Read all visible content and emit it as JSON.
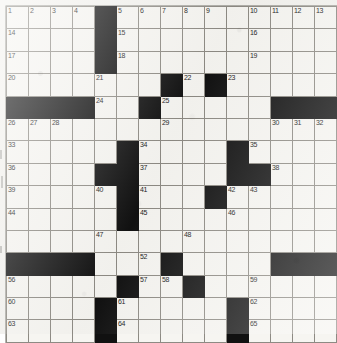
{
  "puzzle": {
    "type": "crossword-grid",
    "rows": 15,
    "columns": 15,
    "colors": {
      "paper": "#f3f2ee",
      "cell_fill": "#f6f5f1",
      "block_fill": "#111111",
      "grid_line": "#8d8a83",
      "number_text": "#1a1a1a"
    },
    "blocks": [
      [
        0,
        4
      ],
      [
        1,
        4
      ],
      [
        2,
        4
      ],
      [
        3,
        7
      ],
      [
        3,
        9
      ],
      [
        4,
        0
      ],
      [
        4,
        1
      ],
      [
        4,
        2
      ],
      [
        4,
        3
      ],
      [
        4,
        6
      ],
      [
        4,
        12
      ],
      [
        4,
        13
      ],
      [
        4,
        14
      ],
      [
        6,
        5
      ],
      [
        6,
        10
      ],
      [
        7,
        4
      ],
      [
        7,
        5
      ],
      [
        7,
        10
      ],
      [
        7,
        11
      ],
      [
        8,
        5
      ],
      [
        8,
        9
      ],
      [
        9,
        5
      ],
      [
        11,
        0
      ],
      [
        11,
        1
      ],
      [
        11,
        2
      ],
      [
        11,
        3
      ],
      [
        11,
        7
      ],
      [
        11,
        12
      ],
      [
        11,
        13
      ],
      [
        11,
        14
      ],
      [
        12,
        5
      ],
      [
        12,
        8
      ],
      [
        13,
        4
      ],
      [
        13,
        10
      ],
      [
        14,
        4
      ],
      [
        14,
        10
      ]
    ],
    "numbers": [
      {
        "row": 0,
        "col": 0,
        "label": "1"
      },
      {
        "row": 0,
        "col": 1,
        "label": "2"
      },
      {
        "row": 0,
        "col": 2,
        "label": "3"
      },
      {
        "row": 0,
        "col": 3,
        "label": "4"
      },
      {
        "row": 0,
        "col": 5,
        "label": "5"
      },
      {
        "row": 0,
        "col": 6,
        "label": "6"
      },
      {
        "row": 0,
        "col": 7,
        "label": "7"
      },
      {
        "row": 0,
        "col": 8,
        "label": "8"
      },
      {
        "row": 0,
        "col": 9,
        "label": "9"
      },
      {
        "row": 0,
        "col": 11,
        "label": "10"
      },
      {
        "row": 0,
        "col": 12,
        "label": "11"
      },
      {
        "row": 0,
        "col": 13,
        "label": "12"
      },
      {
        "row": 0,
        "col": 14,
        "label": "13"
      },
      {
        "row": 1,
        "col": 0,
        "label": "14"
      },
      {
        "row": 1,
        "col": 5,
        "label": "15"
      },
      {
        "row": 1,
        "col": 11,
        "label": "16"
      },
      {
        "row": 2,
        "col": 0,
        "label": "17"
      },
      {
        "row": 2,
        "col": 5,
        "label": "18"
      },
      {
        "row": 2,
        "col": 11,
        "label": "19"
      },
      {
        "row": 3,
        "col": 0,
        "label": "20"
      },
      {
        "row": 3,
        "col": 4,
        "label": "21"
      },
      {
        "row": 3,
        "col": 8,
        "label": "22"
      },
      {
        "row": 3,
        "col": 10,
        "label": "23"
      },
      {
        "row": 4,
        "col": 4,
        "label": "24"
      },
      {
        "row": 4,
        "col": 7,
        "label": "25"
      },
      {
        "row": 5,
        "col": 0,
        "label": "26"
      },
      {
        "row": 5,
        "col": 1,
        "label": "27"
      },
      {
        "row": 5,
        "col": 2,
        "label": "28"
      },
      {
        "row": 5,
        "col": 7,
        "label": "29"
      },
      {
        "row": 5,
        "col": 12,
        "label": "30"
      },
      {
        "row": 5,
        "col": 13,
        "label": "31"
      },
      {
        "row": 5,
        "col": 14,
        "label": "32"
      },
      {
        "row": 6,
        "col": 0,
        "label": "33"
      },
      {
        "row": 6,
        "col": 6,
        "label": "34"
      },
      {
        "row": 6,
        "col": 11,
        "label": "35"
      },
      {
        "row": 7,
        "col": 0,
        "label": "36"
      },
      {
        "row": 7,
        "col": 6,
        "label": "37"
      },
      {
        "row": 7,
        "col": 12,
        "label": "38"
      },
      {
        "row": 8,
        "col": 0,
        "label": "39"
      },
      {
        "row": 8,
        "col": 4,
        "label": "40"
      },
      {
        "row": 8,
        "col": 6,
        "label": "41"
      },
      {
        "row": 8,
        "col": 10,
        "label": "42"
      },
      {
        "row": 8,
        "col": 11,
        "label": "43"
      },
      {
        "row": 9,
        "col": 0,
        "label": "44"
      },
      {
        "row": 9,
        "col": 6,
        "label": "45"
      },
      {
        "row": 9,
        "col": 10,
        "label": "46"
      },
      {
        "row": 10,
        "col": 4,
        "label": "47"
      },
      {
        "row": 10,
        "col": 8,
        "label": "48"
      },
      {
        "row": 11,
        "col": 0,
        "label": "49"
      },
      {
        "row": 11,
        "col": 1,
        "label": "50"
      },
      {
        "row": 11,
        "col": 2,
        "label": "51"
      },
      {
        "row": 11,
        "col": 6,
        "label": "52"
      },
      {
        "row": 11,
        "col": 12,
        "label": "53"
      },
      {
        "row": 11,
        "col": 13,
        "label": "54"
      },
      {
        "row": 11,
        "col": 14,
        "label": "55"
      },
      {
        "row": 12,
        "col": 0,
        "label": "56"
      },
      {
        "row": 12,
        "col": 6,
        "label": "57"
      },
      {
        "row": 12,
        "col": 7,
        "label": "58"
      },
      {
        "row": 12,
        "col": 11,
        "label": "59"
      },
      {
        "row": 13,
        "col": 0,
        "label": "60"
      },
      {
        "row": 13,
        "col": 5,
        "label": "61"
      },
      {
        "row": 13,
        "col": 11,
        "label": "62"
      },
      {
        "row": 14,
        "col": 0,
        "label": "63"
      },
      {
        "row": 14,
        "col": 5,
        "label": "64"
      },
      {
        "row": 14,
        "col": 11,
        "label": "65"
      }
    ]
  }
}
